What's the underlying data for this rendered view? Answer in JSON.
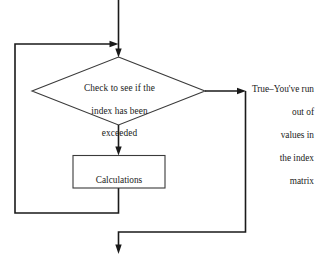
{
  "diagram": {
    "background_color": "#ffffff",
    "line_color": "#1a1a1a",
    "shape_stroke_color": "#3a3a3a"
  },
  "nodes": {
    "decision": {
      "shape": "diamond",
      "text": "Check to see if the index has been exceeded",
      "lines": [
        "Check to see if the",
        "index has been",
        "exceeded"
      ]
    },
    "process": {
      "shape": "rectangle",
      "text": "Calculations",
      "lines": [
        "Calculations"
      ]
    }
  },
  "labels": {
    "true_branch": {
      "text": "True–You've run out of values in the index matrix",
      "lines": [
        "True–You've run",
        "out of",
        "values in",
        "the index",
        "matrix"
      ]
    }
  },
  "connectors": [
    {
      "name": "entry-into-decision",
      "from": "top-of-diagram",
      "to": "decision",
      "direction": "down",
      "arrow": true
    },
    {
      "name": "loop-back-into-entry",
      "from": "process",
      "to": "entry-into-decision",
      "direction": "right",
      "arrow": true
    },
    {
      "name": "decision-true-exit",
      "from": "decision",
      "to": "true-branch",
      "direction": "right",
      "arrow": true
    },
    {
      "name": "decision-false-to-process",
      "from": "decision",
      "to": "process",
      "direction": "down",
      "arrow": true
    },
    {
      "name": "true-branch-to-exit",
      "from": "true-branch",
      "to": "bottom-of-diagram",
      "direction": "down",
      "arrow": true
    }
  ]
}
